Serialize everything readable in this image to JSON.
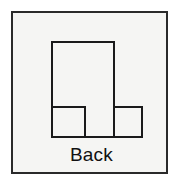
{
  "panel": {
    "background_color": "#f5f5f3",
    "border_color": "#2a2a2a"
  },
  "caption": {
    "label": "Back"
  },
  "figure": {
    "name": "back-orthographic-view",
    "stroke_color": "#1a1a1a",
    "fill_color": "#f5f5f3",
    "stroke_width": 2,
    "outline_path": "M 39 29 L 101 29 L 101 94 L 129 94 L 129 124 L 39 124 Z",
    "internal_lines": [
      "M 39 94 L 72 94",
      "M 72 94 L 72 124",
      "M 101 94 L 101 124"
    ],
    "rectangles": [
      {
        "name": "tall-center-block",
        "x": 39,
        "y": 29,
        "w": 62,
        "h": 95
      },
      {
        "name": "left-step-block",
        "x": 39,
        "y": 94,
        "w": 33,
        "h": 30
      },
      {
        "name": "right-step-block",
        "x": 101,
        "y": 94,
        "w": 28,
        "h": 30
      }
    ]
  }
}
